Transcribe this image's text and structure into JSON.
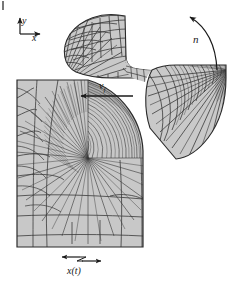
{
  "figure": {
    "background_color": "#ffffff",
    "mesh_fill_color": "#c9c9c9",
    "mesh_line_color": "#3a3a3a",
    "annotation_color": "#1a1a1a",
    "width_px": 236,
    "height_px": 289
  },
  "labels": {
    "axis_y": "y",
    "axis_x": "x",
    "rotation": "n",
    "feed_velocity": "v",
    "feed_velocity_sub": "f",
    "position": "x(t)"
  },
  "annotations": {
    "coordinate_frame": {
      "name": "coordinate-axes",
      "origin_px": [
        20,
        34
      ],
      "y_arrow_to_px": [
        20,
        16
      ],
      "x_arrow_to_px": [
        40,
        34
      ]
    },
    "rotation_arrow": {
      "name": "rotation-arrow",
      "direction": "counterclockwise",
      "arrowhead_px": [
        188,
        16
      ]
    },
    "feed_arrow": {
      "name": "feed-velocity-arrow",
      "direction": "left",
      "from_px": [
        132,
        95
      ],
      "to_px": [
        80,
        95
      ]
    },
    "position_arrow": {
      "name": "position-double-arrow",
      "direction": "both",
      "left_px": [
        62,
        258
      ],
      "right_px": [
        100,
        258
      ]
    }
  },
  "parts": [
    {
      "name": "workpiece-block",
      "description": "Rectangular workpiece with graded quadrilateral mesh and concave circular cut arc at upper right",
      "bounds_px": [
        17,
        80,
        143,
        247
      ]
    },
    {
      "name": "chip-upper-tool-mesh",
      "description": "Curved fan-shaped tool segment mesh above the cut, top-left of tool body",
      "bounds_px": [
        58,
        14,
        142,
        90
      ]
    },
    {
      "name": "tool-right-segment-mesh",
      "description": "Fan-shaped rotating tool segment mesh at right of the cut",
      "bounds_px": [
        143,
        64,
        228,
        160
      ]
    },
    {
      "name": "tool-connecting-band",
      "description": "Thin meshed band linking the two tool segments across the top of the cut"
    }
  ]
}
